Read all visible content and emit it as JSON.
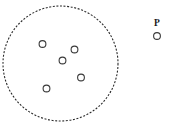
{
  "figure": {
    "background_color": "#ffffff",
    "width": 169,
    "height": 140
  },
  "boundary": {
    "name": "dashed-region-boundary",
    "shape": "circle",
    "center_x": 60.5,
    "center_y": 63.5,
    "radius": 57.5,
    "stroke_color": "#2b2b2b",
    "stroke_width": 1.1,
    "dash_pattern": "2 1.6",
    "fill": "none"
  },
  "inner_points": [
    {
      "id": "inner-point-1",
      "label": "",
      "cx": 42.5,
      "cy": 44.0,
      "r": 3.4
    },
    {
      "id": "inner-point-2",
      "label": "",
      "cx": 74.5,
      "cy": 49.5,
      "r": 3.4
    },
    {
      "id": "inner-point-3",
      "label": "",
      "cx": 62.5,
      "cy": 60.5,
      "r": 3.4
    },
    {
      "id": "inner-point-4",
      "label": "",
      "cx": 81.0,
      "cy": 77.5,
      "r": 3.4
    },
    {
      "id": "inner-point-5",
      "label": "",
      "cx": 46.5,
      "cy": 88.5,
      "r": 3.4
    }
  ],
  "outer_points": [
    {
      "id": "outer-point-p",
      "label": "P",
      "cx": 157.0,
      "cy": 36.0,
      "r": 3.4,
      "label_x": 157.0,
      "label_y": 26.0
    }
  ],
  "style": {
    "point_stroke_color": "#3a3a3a",
    "point_fill_color": "#ffffff",
    "point_stroke_width": 1.1,
    "label_color": "#1a1a1a",
    "label_font_size": 9.5
  }
}
